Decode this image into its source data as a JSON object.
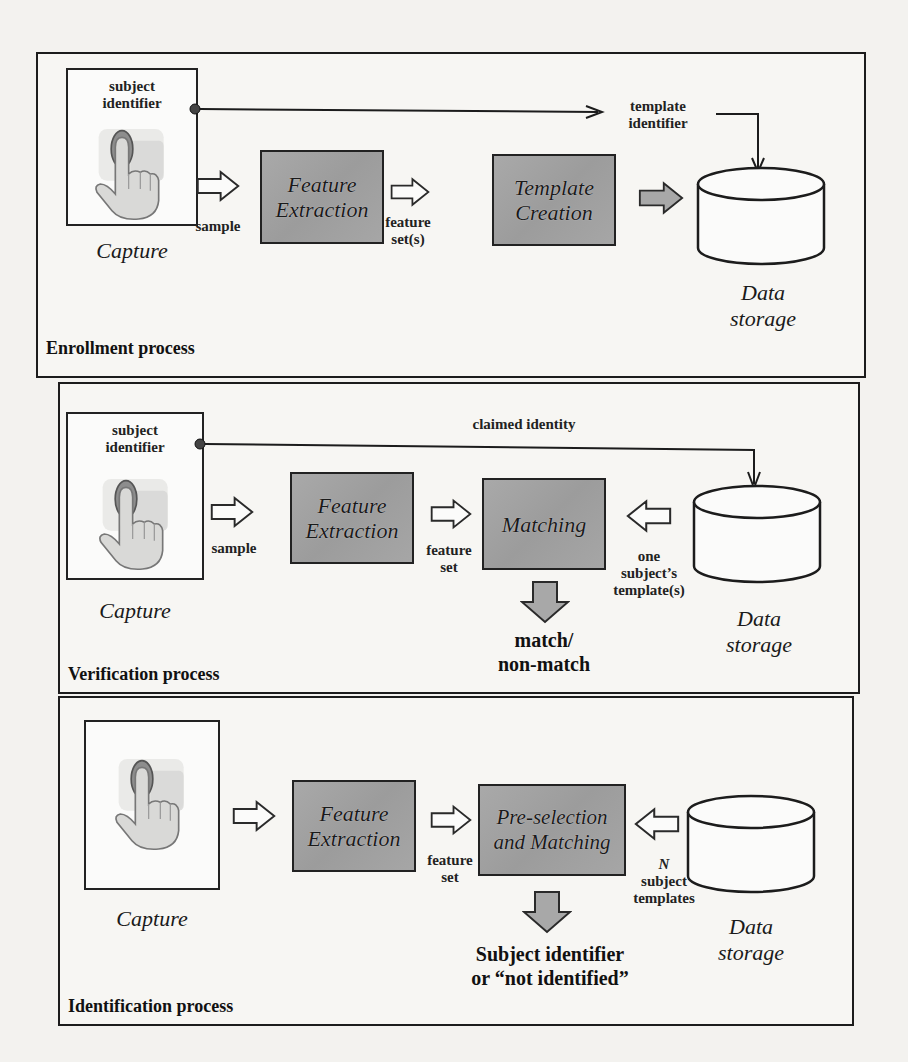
{
  "colors": {
    "page_bg": "#f3f2ef",
    "box_fill": "#a3a3a3",
    "line": "#1c1c1c",
    "arrow_fill_gray": "#a8a8a8",
    "fingertip": "#8a8a8a"
  },
  "icons": {
    "capture": "finger-touch-hand-icon",
    "storage": "database-cylinder-icon",
    "flow_arrow": "block-arrow-icon",
    "connector_dot": "dot-icon"
  },
  "enrollment": {
    "title": "Enrollment process",
    "capture": {
      "top_label_1": "subject",
      "top_label_2": "identifier",
      "caption": "Capture"
    },
    "sample_label": "sample",
    "feature_extraction": {
      "line1": "Feature",
      "line2": "Extraction"
    },
    "feature_label_1": "feature",
    "feature_label_2": "set(s)",
    "template_creation": {
      "line1": "Template",
      "line2": "Creation"
    },
    "template_identifier_1": "template",
    "template_identifier_2": "identifier",
    "storage": {
      "line1": "Data",
      "line2": "storage"
    }
  },
  "verification": {
    "title": "Verification process",
    "capture": {
      "top_label_1": "subject",
      "top_label_2": "identifier",
      "caption": "Capture"
    },
    "claimed_identity": "claimed identity",
    "sample_label": "sample",
    "feature_extraction": {
      "line1": "Feature",
      "line2": "Extraction"
    },
    "feature_label_1": "feature",
    "feature_label_2": "set",
    "matching": "Matching",
    "template_label_1": "one",
    "template_label_2": "subject’s",
    "template_label_3": "template(s)",
    "storage": {
      "line1": "Data",
      "line2": "storage"
    },
    "result_1": "match/",
    "result_2": "non-match"
  },
  "identification": {
    "title": "Identification process",
    "capture": {
      "caption": "Capture"
    },
    "feature_extraction": {
      "line1": "Feature",
      "line2": "Extraction"
    },
    "feature_label_1": "feature",
    "feature_label_2": "set",
    "matching": {
      "line1": "Pre-selection",
      "line2": "and Matching"
    },
    "template_label_1": "N",
    "template_label_2": "subject",
    "template_label_3": "templates",
    "storage": {
      "line1": "Data",
      "line2": "storage"
    },
    "result_1": "Subject identifier",
    "result_2": "or “not identified”"
  }
}
